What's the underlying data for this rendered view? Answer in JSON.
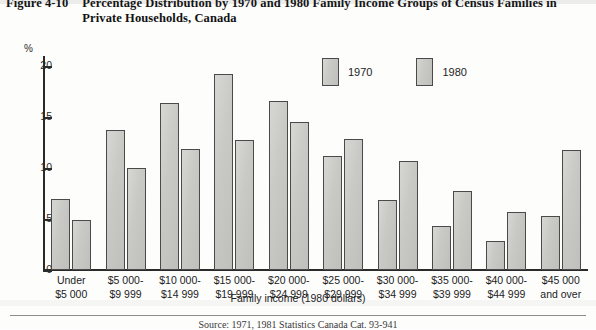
{
  "figure": {
    "number": "Figure 4-10",
    "title": "Percentage Distribution by 1970 and 1980 Family Income Groups of Census Families in Private Households, Canada"
  },
  "axes": {
    "y_unit": "%",
    "y_ticks": [
      "0",
      "5",
      "10",
      "15",
      "20"
    ],
    "x_title": "Family income (1980 dollars)"
  },
  "legend": {
    "items": [
      {
        "label": "1970",
        "color": "#cacac7"
      },
      {
        "label": "1980",
        "color": "#cacac7"
      }
    ]
  },
  "source_note": "Source: 1971, 1981 Statistics Canada Cat. 93-941",
  "chart_data": {
    "type": "bar",
    "title": "Percentage Distribution by 1970 and 1980 Family Income Groups of Census Families in Private Households, Canada",
    "xlabel": "Family income (1980 dollars)",
    "ylabel": "%",
    "ylim": [
      0,
      21
    ],
    "yticks": [
      0,
      5,
      10,
      15,
      20
    ],
    "grid": false,
    "legend_position": "top-center",
    "categories": [
      "Under\n$5 000",
      "$5 000-\n$9 999",
      "$10 000-\n$14 999",
      "$15 000-\n$19 999",
      "$20 000-\n$24 999",
      "$25 000-\n$29 999",
      "$30 000-\n$34 999",
      "$35 000-\n$39 999",
      "$40 000-\n$44 999",
      "$45 000\nand over"
    ],
    "category_lines": [
      [
        "Under",
        "$5 000"
      ],
      [
        "$5 000-",
        "$9 999"
      ],
      [
        "$10 000-",
        "$14 999"
      ],
      [
        "$15 000-",
        "$19 999"
      ],
      [
        "$20 000-",
        "$24 999"
      ],
      [
        "$25 000-",
        "$29 999"
      ],
      [
        "$30 000-",
        "$34 999"
      ],
      [
        "$35 000-",
        "$39 999"
      ],
      [
        "$40 000-",
        "$44 999"
      ],
      [
        "$45 000",
        "and over"
      ]
    ],
    "series": [
      {
        "name": "1970",
        "values": [
          7.0,
          13.7,
          16.4,
          19.2,
          16.6,
          11.2,
          6.9,
          4.3,
          2.8,
          5.3
        ]
      },
      {
        "name": "1980",
        "values": [
          4.9,
          10.0,
          11.9,
          12.8,
          14.5,
          12.9,
          10.7,
          7.8,
          5.7,
          11.8
        ]
      }
    ]
  }
}
